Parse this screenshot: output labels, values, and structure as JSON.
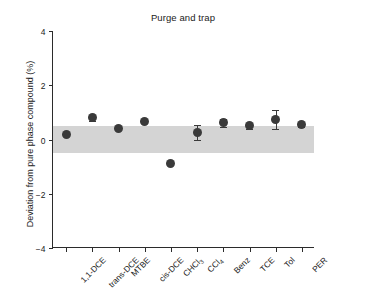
{
  "chart_data": {
    "type": "scatter",
    "title": "Purge and trap",
    "xlabel": "",
    "ylabel": "Deviation from pure phase compound (%)",
    "ylim": [
      -4,
      4
    ],
    "yticks": [
      4,
      2,
      0,
      -2,
      -4
    ],
    "ytick_labels": [
      "4",
      "2",
      "0",
      "−2",
      "−4"
    ],
    "grid": false,
    "legend": null,
    "categories": [
      "1,1-DCE",
      "trans-DCE",
      "MTBE",
      "cis-DCE",
      "CHCl3",
      "CCl4",
      "Benz",
      "TCE",
      "Tol",
      "PER"
    ],
    "category_labels_html": [
      "1,1-DCE",
      "trans-DCE",
      "MTBE",
      "cis-DCE",
      "CHCl<sub>3</sub>",
      "CCl<sub>4</sub>",
      "Benz",
      "TCE",
      "Tol",
      "PER"
    ],
    "values": [
      0.2,
      0.8,
      0.4,
      0.65,
      -0.9,
      0.27,
      0.62,
      0.5,
      0.75,
      0.55
    ],
    "errors": [
      0.0,
      0.12,
      0.0,
      0.0,
      0.0,
      0.28,
      0.15,
      0.1,
      0.35,
      0.1
    ],
    "annotations": [
      {
        "name": "acceptance-band",
        "type": "hband",
        "y_low": -0.5,
        "y_high": 0.5,
        "color": "#d4d4d4"
      }
    ],
    "marker_color": "#3a3a3a",
    "axis_color": "#2b2b2b"
  }
}
